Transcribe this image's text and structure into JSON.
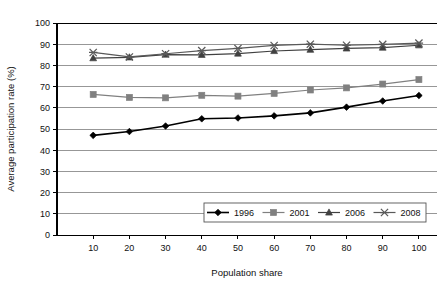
{
  "chart_data": {
    "type": "line",
    "title": "",
    "subtitle": "",
    "xlabel": "Population share",
    "ylabel": "Average participation rate (%)",
    "xlim": [
      0,
      105
    ],
    "ylim": [
      0,
      100
    ],
    "ytick_step": 10,
    "grid": true,
    "grid_axis": "y",
    "legend_position": "bottom-right-inside",
    "x": [
      10,
      20,
      30,
      40,
      50,
      60,
      70,
      80,
      90,
      100
    ],
    "xtick_labels": [
      "10",
      "20",
      "30",
      "40",
      "50",
      "60",
      "70",
      "80",
      "90",
      "100"
    ],
    "ytick_labels": [
      "0",
      "10",
      "20",
      "30",
      "40",
      "50",
      "60",
      "70",
      "80",
      "90",
      "100"
    ],
    "series": [
      {
        "name": "1996",
        "marker": "diamond",
        "color": "#000000",
        "values": [
          47.0,
          48.8,
          51.4,
          54.8,
          55.2,
          56.2,
          57.6,
          60.3,
          63.2,
          65.8
        ]
      },
      {
        "name": "2001",
        "marker": "square",
        "color": "#808080",
        "values": [
          66.3,
          64.9,
          64.7,
          65.9,
          65.5,
          66.8,
          68.4,
          69.4,
          71.2,
          73.3
        ]
      },
      {
        "name": "2006",
        "marker": "triangle",
        "color": "#404040",
        "values": [
          83.4,
          83.8,
          85.1,
          85.0,
          85.6,
          86.8,
          87.4,
          88.0,
          88.4,
          89.5
        ]
      },
      {
        "name": "2008",
        "marker": "x",
        "color": "#595959",
        "values": [
          86.1,
          84.0,
          85.5,
          87.0,
          88.0,
          89.4,
          90.0,
          89.5,
          89.9,
          90.5
        ]
      }
    ]
  },
  "legend": {
    "entries": [
      {
        "label": "1996"
      },
      {
        "label": "2001"
      },
      {
        "label": "2006"
      },
      {
        "label": "2008"
      }
    ]
  },
  "colors": {
    "axis": "#000000",
    "grid": "#8c8c8c",
    "plot_background": "#ffffff",
    "series_1996": "#000000",
    "series_2001": "#808080",
    "series_2006": "#404040",
    "series_2008": "#595959"
  }
}
